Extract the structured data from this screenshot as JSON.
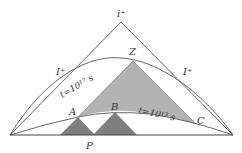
{
  "diagram": {
    "type": "conformal-spacetime-diagram",
    "labels": {
      "apex": "i⁺",
      "scri_left": "I⁺",
      "scri_right": "I⁺",
      "upper_curve": "t=10¹⁷ s",
      "lower_curve": "t=10¹³ s",
      "point_Z": "Z",
      "point_A": "A",
      "point_B": "B",
      "point_C": "C",
      "point_P": "P"
    },
    "colors": {
      "lines": "#555555",
      "light_cone_fill": "#b3b3b3",
      "past_cone_fill": "#808080",
      "background": "#ffffff"
    }
  }
}
